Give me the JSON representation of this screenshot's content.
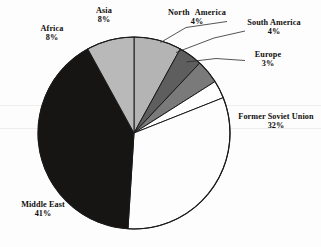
{
  "chart_data": {
    "type": "pie",
    "title": "",
    "subtitle": "",
    "xlabel": "",
    "ylabel": "",
    "legend_position": "none",
    "grid": false,
    "labels_show_percent": true,
    "total_percent": 100,
    "categories": [
      "Asia",
      "North America",
      "South America",
      "Europe",
      "Former Soviet Union",
      "Middle East",
      "Africa"
    ],
    "values": [
      8,
      4,
      4,
      3,
      32,
      41,
      8
    ],
    "slices": [
      {
        "name": "Asia",
        "value": 8,
        "value_label": "8%",
        "color": "#b4b4b4",
        "start_angle": 0,
        "end_angle": 28.8,
        "label_placement": "outside-top-left",
        "leader_line": false
      },
      {
        "name": "North America",
        "value": 4,
        "value_label": "4%",
        "color": "#5e5e5e",
        "start_angle": 28.8,
        "end_angle": 43.2,
        "label_placement": "outside-top",
        "leader_line": true
      },
      {
        "name": "South America",
        "value": 4,
        "value_label": "4%",
        "color": "#7a7a7a",
        "start_angle": 43.2,
        "end_angle": 57.6,
        "label_placement": "outside-top-right",
        "leader_line": true
      },
      {
        "name": "Europe",
        "value": 3,
        "value_label": "3%",
        "color": "#ffffff",
        "start_angle": 57.6,
        "end_angle": 68.4,
        "label_placement": "outside-right",
        "leader_line": true
      },
      {
        "name": "Former Soviet Union",
        "value": 32,
        "value_label": "32%",
        "color": "#fdfdfd",
        "start_angle": 68.4,
        "end_angle": 183.6,
        "label_placement": "outside-right",
        "leader_line": false
      },
      {
        "name": "Middle East",
        "value": 41,
        "value_label": "41%",
        "color": "#171513",
        "start_angle": 183.6,
        "end_angle": 331.2,
        "label_placement": "outside-bottom-left",
        "leader_line": false
      },
      {
        "name": "Africa",
        "value": 8,
        "value_label": "8%",
        "color": "#b9b9b9",
        "start_angle": 331.2,
        "end_angle": 360,
        "label_placement": "outside-left",
        "leader_line": false
      }
    ],
    "geometry": {
      "center_x": 134,
      "center_y": 133,
      "radius": 96,
      "outline_color": "#1a1a1a"
    }
  },
  "labels": {
    "asia": {
      "name": "Asia",
      "value": "8%"
    },
    "africa": {
      "name": "Africa",
      "value": "8%"
    },
    "north_america": {
      "name": "North  America",
      "value": "4%"
    },
    "south_america": {
      "name": "South America",
      "value": "4%"
    },
    "europe": {
      "name": "Europe",
      "value": "3%"
    },
    "former_soviet": {
      "name": "Former Soviet Union",
      "value": "32%"
    },
    "middle_east": {
      "name": "Middle East",
      "value": "41%"
    }
  },
  "colors": {
    "background": "#fdfdfd",
    "outline": "#1a1a1a",
    "text": "#100e0c",
    "leader_line": "#2b2b2b",
    "scan_artifact": "#f0eeec"
  }
}
